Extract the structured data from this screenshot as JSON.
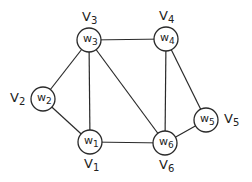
{
  "diagram": {
    "type": "undirected-graph",
    "nodes": [
      {
        "id": "w1",
        "label": "w",
        "sub": "1",
        "vertex_label": "V",
        "vertex_sub": "1",
        "x": 90,
        "y": 142,
        "label_pos": "below"
      },
      {
        "id": "w2",
        "label": "w",
        "sub": "2",
        "vertex_label": "V",
        "vertex_sub": "2",
        "x": 43,
        "y": 99,
        "label_pos": "left"
      },
      {
        "id": "w3",
        "label": "w",
        "sub": "3",
        "vertex_label": "V",
        "vertex_sub": "3",
        "x": 89,
        "y": 40,
        "label_pos": "above"
      },
      {
        "id": "w4",
        "label": "w",
        "sub": "4",
        "vertex_label": "V",
        "vertex_sub": "4",
        "x": 166,
        "y": 39,
        "label_pos": "above"
      },
      {
        "id": "w5",
        "label": "w",
        "sub": "5",
        "vertex_label": "V",
        "vertex_sub": "5",
        "x": 206,
        "y": 120,
        "label_pos": "right"
      },
      {
        "id": "w6",
        "label": "w",
        "sub": "6",
        "vertex_label": "V",
        "vertex_sub": "6",
        "x": 165,
        "y": 143,
        "label_pos": "below"
      }
    ],
    "edges": [
      [
        "w3",
        "w4"
      ],
      [
        "w3",
        "w2"
      ],
      [
        "w3",
        "w1"
      ],
      [
        "w3",
        "w6"
      ],
      [
        "w2",
        "w1"
      ],
      [
        "w1",
        "w6"
      ],
      [
        "w4",
        "w6"
      ],
      [
        "w4",
        "w5"
      ],
      [
        "w5",
        "w6"
      ]
    ],
    "node_radius": 12,
    "colors": {
      "stroke": "#2a2a2a",
      "fill": "#ffffff",
      "text": "#222222"
    }
  }
}
